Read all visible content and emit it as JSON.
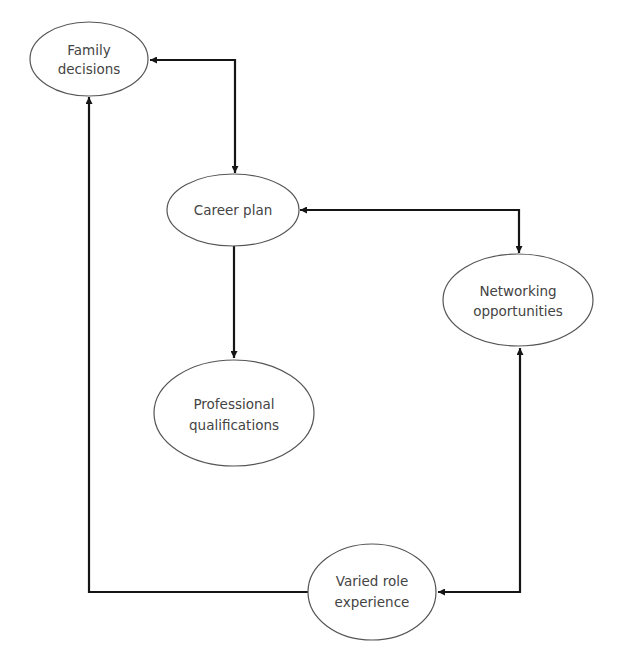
{
  "diagram": {
    "colors": {
      "edge": "#151515",
      "node_outline": "#555555",
      "text": "#444444",
      "background": "#ffffff"
    },
    "nodes": [
      {
        "id": "family",
        "lines": [
          "Family",
          "decisions"
        ],
        "cx": 89,
        "cy": 59,
        "rx": 59,
        "ry": 37
      },
      {
        "id": "career",
        "lines": [
          "Career plan"
        ],
        "cx": 233,
        "cy": 210,
        "rx": 66,
        "ry": 36
      },
      {
        "id": "networking",
        "lines": [
          "Networking",
          "opportunities"
        ],
        "cx": 518,
        "cy": 300,
        "rx": 75,
        "ry": 46
      },
      {
        "id": "professional",
        "lines": [
          "Professional",
          "qualifications"
        ],
        "cx": 234,
        "cy": 413,
        "rx": 80,
        "ry": 53
      },
      {
        "id": "varied",
        "lines": [
          "Varied role",
          "experience"
        ],
        "cx": 372,
        "cy": 592,
        "rx": 64,
        "ry": 48
      }
    ],
    "edges": [
      {
        "id": "family-career",
        "from": "family",
        "to": "career",
        "bidirectional": true
      },
      {
        "id": "career-networking",
        "from": "career",
        "to": "networking",
        "bidirectional": true
      },
      {
        "id": "career-professional",
        "from": "career",
        "to": "professional",
        "bidirectional": false
      },
      {
        "id": "varied-family",
        "from": "varied",
        "to": "family",
        "bidirectional": false
      },
      {
        "id": "varied-networking",
        "from": "varied",
        "to": "networking",
        "bidirectional": true
      }
    ]
  }
}
